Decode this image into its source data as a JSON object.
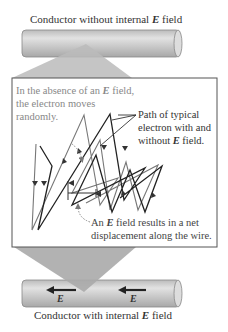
{
  "top_title": {
    "prefix": "Conductor without internal ",
    "field_symbol": "E",
    "suffix": " field"
  },
  "bottom_title": {
    "prefix": "Conductor with internal ",
    "field_symbol": "E",
    "suffix": " field"
  },
  "annotations": {
    "random_line1_prefix": "In the absence of an ",
    "random_line1_symbol": "E",
    "random_line1_suffix": " field,",
    "random_line2": "the electron moves",
    "random_line3": "randomly.",
    "path_line1": "Path of typical",
    "path_line2": "electron with and",
    "path_line3_prefix": "without ",
    "path_line3_symbol": "E",
    "path_line3_suffix": " field.",
    "net_line1_prefix": "An ",
    "net_line1_symbol": "E",
    "net_line1_suffix": " field results in a net",
    "net_line2": "displacement along the wire."
  },
  "field_arrows": [
    {
      "label": "E"
    },
    {
      "label": "E"
    }
  ],
  "colors": {
    "cylinder": "#c8c8c8",
    "cylinder_dark": "#999999",
    "frame": "#555555",
    "random_path": "#777777",
    "field_path": "#222222"
  }
}
